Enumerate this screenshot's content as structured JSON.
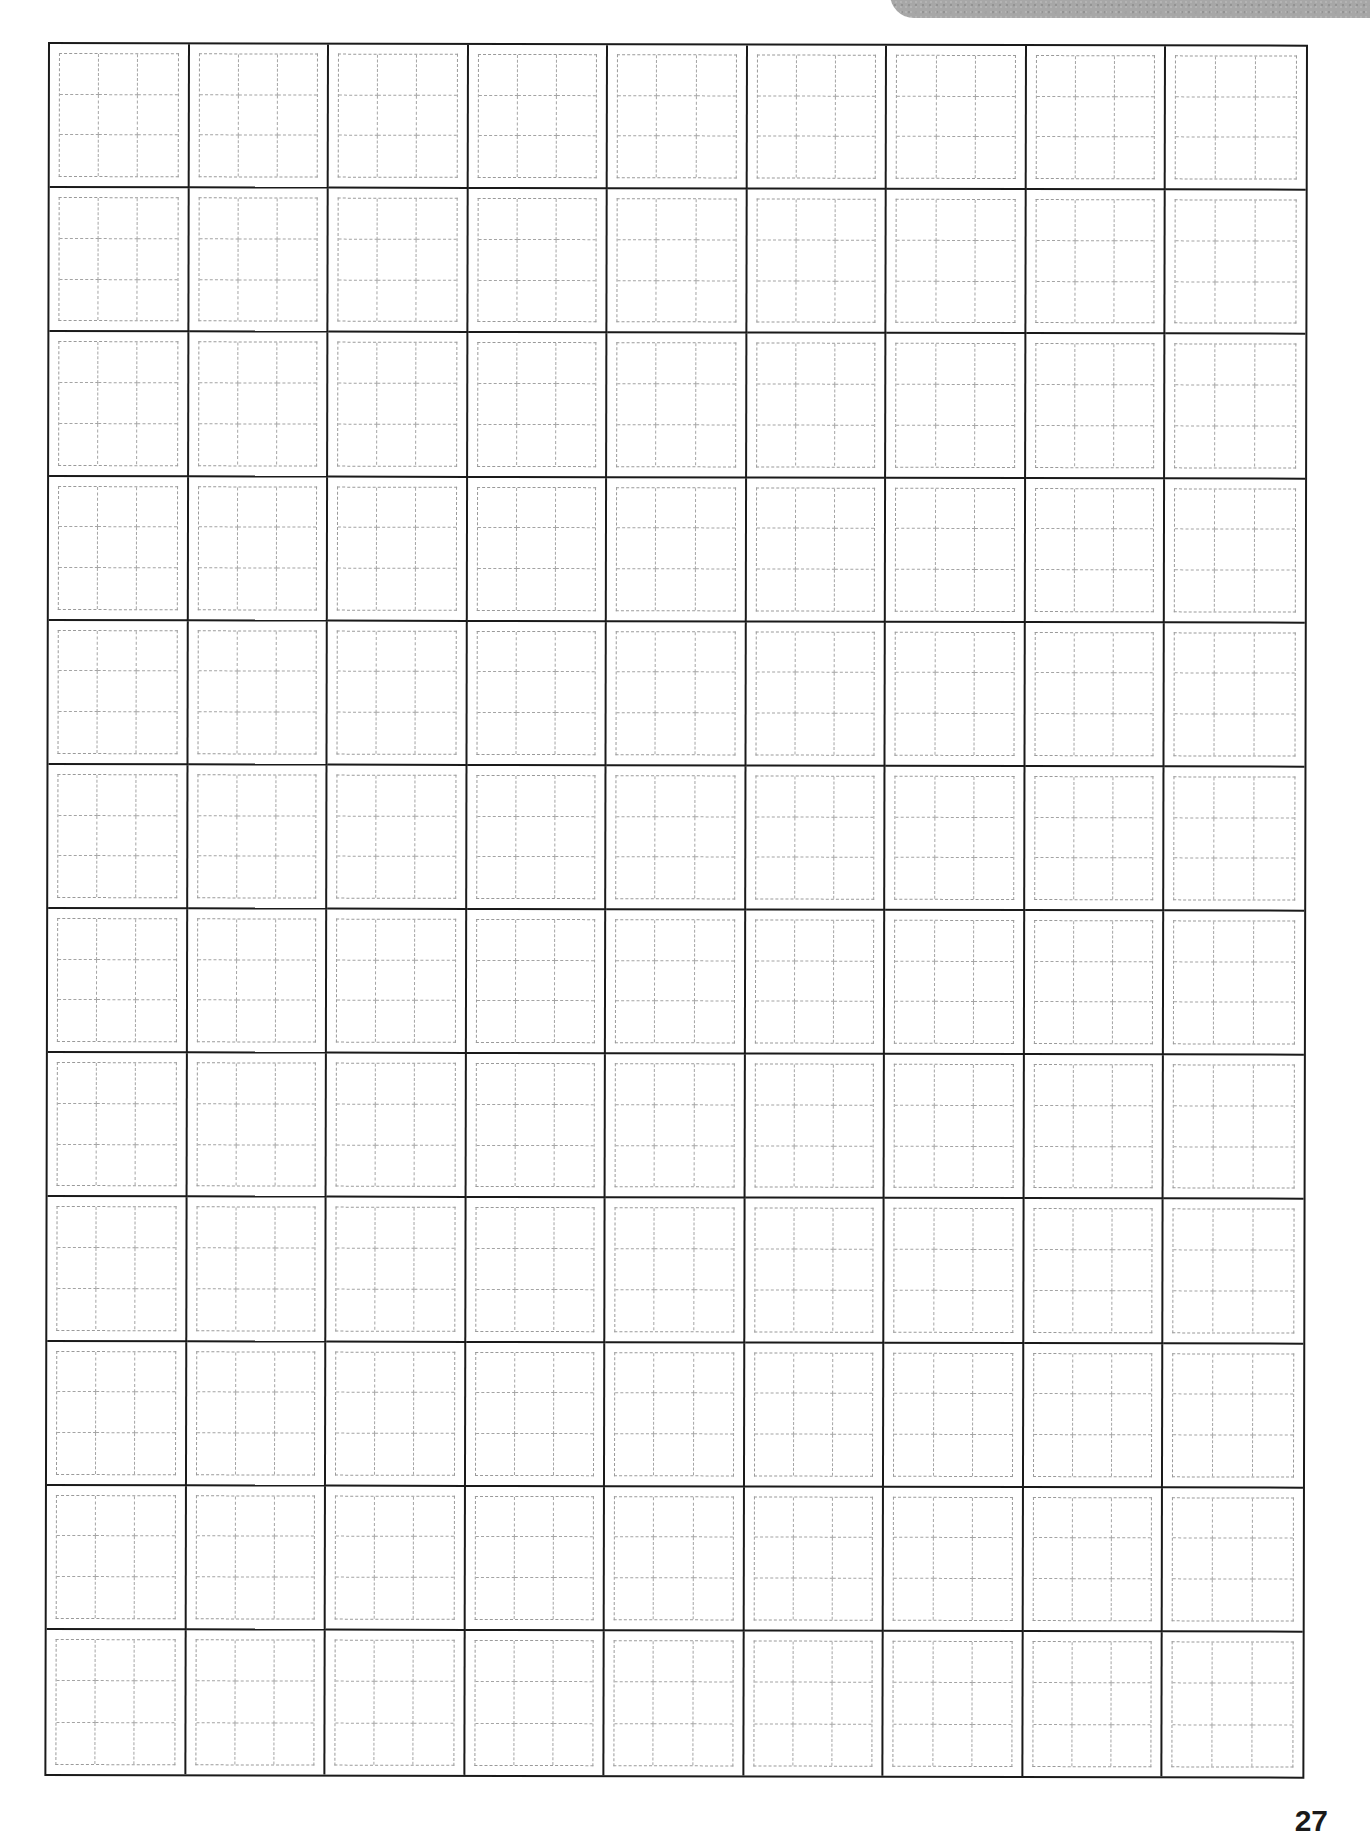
{
  "page": {
    "type": "handwriting practice grid (tian-zi-ge style, 3x3 subdivided)",
    "header_tab_color": "#a7a7a7",
    "page_number": "27"
  },
  "grid": {
    "columns": 9,
    "rows": 12,
    "cell_subdivisions": "3x3",
    "outer_border_color": "#1a1a1a",
    "guide_line_color": "#9a9a9a",
    "cells_content": "empty"
  }
}
